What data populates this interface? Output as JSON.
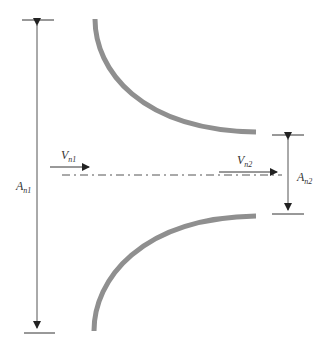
{
  "diagram": {
    "type": "nozzle",
    "colors": {
      "wall": "#8f8f8f",
      "line": "#333333",
      "centerline": "#555555",
      "background": "#ffffff"
    },
    "labels": {
      "inlet_area": {
        "main": "A",
        "sub": "n1"
      },
      "outlet_area": {
        "main": "A",
        "sub": "n2"
      },
      "inlet_velocity": {
        "main": "V",
        "sub": "n1"
      },
      "outlet_velocity": {
        "main": "V",
        "sub": "n2"
      }
    },
    "elements": [
      "upper-nozzle-wall",
      "lower-nozzle-wall",
      "centerline",
      "inlet-area-dimension",
      "outlet-area-dimension",
      "inlet-velocity-arrow",
      "outlet-velocity-arrow"
    ]
  }
}
